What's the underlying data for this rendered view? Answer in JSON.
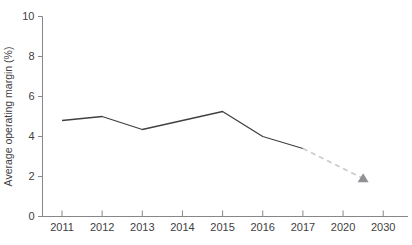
{
  "chart": {
    "ylabel": "Average operating margin (%)"
  },
  "chart_data": {
    "type": "line",
    "title": "",
    "xlabel": "",
    "ylabel": "Average operating margin (%)",
    "categories": [
      "2011",
      "2012",
      "2013",
      "2014",
      "2015",
      "2016",
      "2017",
      "2020",
      "2030"
    ],
    "yticks": [
      0,
      2,
      4,
      6,
      8,
      10
    ],
    "ylim": [
      0,
      10
    ],
    "grid": false,
    "legend": "none",
    "series": [
      {
        "name": "actual",
        "line_style": "solid",
        "color": "#414042",
        "points": [
          {
            "category": "2011",
            "xi": 0,
            "value": 4.8
          },
          {
            "category": "2012",
            "xi": 1,
            "value": 5.0
          },
          {
            "category": "2013",
            "xi": 2,
            "value": 4.35
          },
          {
            "category": "2014",
            "xi": 3,
            "value": 4.8
          },
          {
            "category": "2015",
            "xi": 4,
            "value": 5.25
          },
          {
            "category": "2016",
            "xi": 5,
            "value": 4.0
          },
          {
            "category": "2017",
            "xi": 6,
            "value": 3.4
          }
        ]
      },
      {
        "name": "forecast",
        "line_style": "dashed",
        "color": "#c9cacb",
        "end_marker": "triangle-up",
        "marker_color": "#8f9093",
        "points": [
          {
            "category": "2017",
            "xi": 6,
            "value": 3.4
          },
          {
            "category": "mid-2020-2030",
            "xi": 7.5,
            "value": 1.9
          }
        ]
      }
    ],
    "axis_color": "#858789",
    "tick_label_color": "#414042"
  }
}
